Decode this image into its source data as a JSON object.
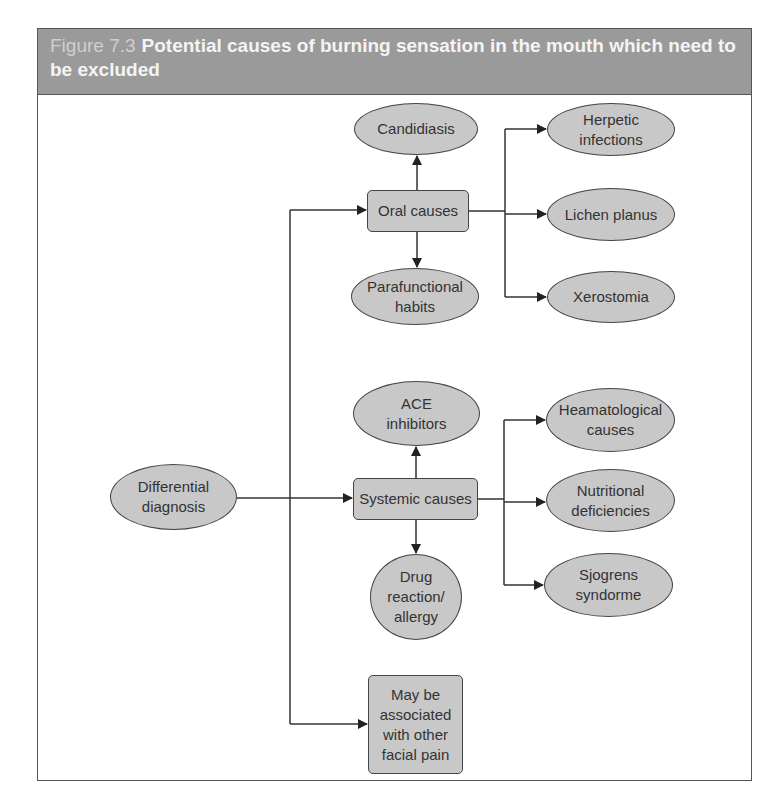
{
  "figure": {
    "label": "Figure 7.3",
    "title": "Potential causes of burning sensation in the mouth which need to be excluded"
  },
  "nodes": {
    "differential": "Differential\ndiagnosis",
    "oral": "Oral causes",
    "candidiasis": "Candidiasis",
    "parafunctional": "Parafunctional\nhabits",
    "herpetic": "Herpetic\ninfections",
    "lichen": "Lichen planus",
    "xerostomia": "Xerostomia",
    "systemic": "Systemic causes",
    "ace": "ACE\ninhibitors",
    "drug": "Drug\nreaction/\nallergy",
    "heamatological": "Heamatological\ncauses",
    "nutritional": "Nutritional\ndeficiencies",
    "sjogrens": "Sjogrens\nsyndorme",
    "facial": "May be\nassociated\nwith other\nfacial pain"
  },
  "colors": {
    "header_bg": "#9a9a9a",
    "node_fill": "#c8c8c8",
    "line": "#333333"
  }
}
